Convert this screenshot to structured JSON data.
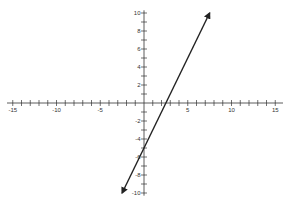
{
  "chart_data": {
    "type": "line",
    "title": "",
    "xlabel": "",
    "ylabel": "",
    "xlim": [
      -15,
      15
    ],
    "ylim": [
      -10,
      10
    ],
    "x_tick_labels": [
      "-15",
      "-10",
      "-5",
      "5",
      "10",
      "15"
    ],
    "y_tick_labels": [
      "10",
      "8",
      "6",
      "4",
      "2",
      "-2",
      "-4",
      "-6",
      "-8",
      "-10"
    ],
    "x_tick_step": 1,
    "y_tick_step": 1,
    "grid": false,
    "legend": null,
    "series": [
      {
        "name": "y = 2x - 5",
        "equation": "y = 2x - 5",
        "slope": 2,
        "intercept": -5,
        "x": [
          -2.5,
          7.5
        ],
        "y": [
          -10,
          10
        ],
        "arrows": "both",
        "color": "#222222"
      }
    ]
  },
  "style": {
    "axis_color": "#333333",
    "line_color": "#222222"
  }
}
